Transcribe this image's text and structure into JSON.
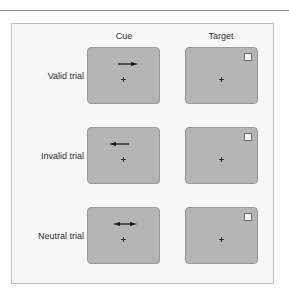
{
  "columns": [
    {
      "label": "Cue"
    },
    {
      "label": "Target"
    }
  ],
  "rows": [
    {
      "label": "Valid trial",
      "cue": "arrow-right",
      "target_position": "top-right"
    },
    {
      "label": "Invalid trial",
      "cue": "arrow-left",
      "target_position": "top-right"
    },
    {
      "label": "Neutral trial",
      "cue": "arrow-double",
      "target_position": "top-right"
    }
  ],
  "colors": {
    "box_fill": "#b5b5b5",
    "box_border": "#9a9a9a",
    "panel_fill": "#f7f7f7",
    "arrow": "#1a1a1a",
    "target": "#ffffff"
  }
}
